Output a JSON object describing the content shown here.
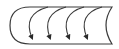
{
  "diagram": {
    "type": "icon",
    "icon_name": "curved-arrows-band-icon",
    "arrow_count": 4,
    "stroke_color": "#3a3a3a",
    "background": "#ffffff"
  }
}
